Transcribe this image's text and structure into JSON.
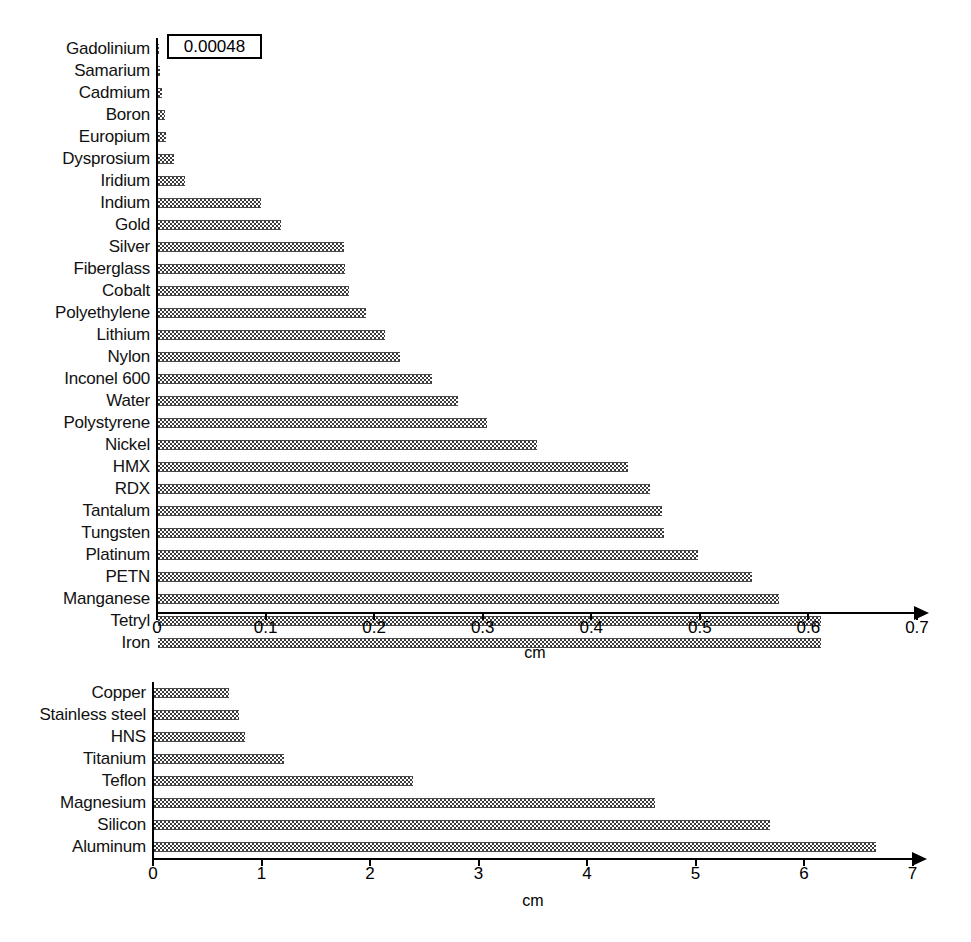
{
  "chart_data": [
    {
      "type": "bar",
      "orientation": "horizontal",
      "title": "",
      "xlabel": "cm",
      "ylabel": "",
      "xlim": [
        0,
        0.7
      ],
      "xticks": [
        "0",
        "0.1",
        "0.2",
        "0.3",
        "0.4",
        "0.5",
        "0.6",
        "0.7"
      ],
      "xtick_values": [
        0,
        0.1,
        0.2,
        0.3,
        0.4,
        0.5,
        0.6,
        0.7
      ],
      "grid": false,
      "legend": "none",
      "annotations": [
        {
          "text": "0.00048",
          "target_category": "Gadolinium",
          "boxed": true
        }
      ],
      "categories": [
        "Gadolinium",
        "Samarium",
        "Cadmium",
        "Boron",
        "Europium",
        "Dysprosium",
        "Iridium",
        "Indium",
        "Gold",
        "Silver",
        "Fiberglass",
        "Cobalt",
        "Polyethylene",
        "Lithium",
        "Nylon",
        "Inconel 600",
        "Water",
        "Polystyrene",
        "Nickel",
        "HMX",
        "RDX",
        "Tantalum",
        "Tungsten",
        "Platinum",
        "PETN",
        "Manganese",
        "Tetryl",
        "Iron"
      ],
      "values": [
        0.00048,
        0.0015,
        0.004,
        0.006,
        0.007,
        0.015,
        0.025,
        0.095,
        0.113,
        0.171,
        0.172,
        0.176,
        0.192,
        0.209,
        0.223,
        0.252,
        0.276,
        0.303,
        0.349,
        0.433,
        0.453,
        0.464,
        0.466,
        0.497,
        0.547,
        0.572,
        0.611,
        0.611
      ]
    },
    {
      "type": "bar",
      "orientation": "horizontal",
      "title": "",
      "xlabel": "cm",
      "ylabel": "",
      "xlim": [
        0,
        7
      ],
      "xticks": [
        "0",
        "1",
        "2",
        "3",
        "4",
        "5",
        "6",
        "7"
      ],
      "xtick_values": [
        0,
        1,
        2,
        3,
        4,
        5,
        6,
        7
      ],
      "grid": false,
      "legend": "none",
      "annotations": [],
      "categories": [
        "Copper",
        "Stainless steel",
        "HNS",
        "Titanium",
        "Teflon",
        "Magnesium",
        "Silicon",
        "Aluminum"
      ],
      "values": [
        0.69,
        0.78,
        0.84,
        1.2,
        2.39,
        4.62,
        5.68,
        6.65
      ]
    }
  ],
  "layout": {
    "top_chart": {
      "axis_origin_x": 156,
      "pixels_per_unit": 1085.7,
      "first_row_top": 38,
      "row_height": 22,
      "label_right_edge": 150
    },
    "bottom_chart": {
      "axis_origin_x": 152,
      "pixels_per_unit": 108.5,
      "first_row_top": 682,
      "row_height": 22,
      "label_right_edge": 146
    }
  }
}
